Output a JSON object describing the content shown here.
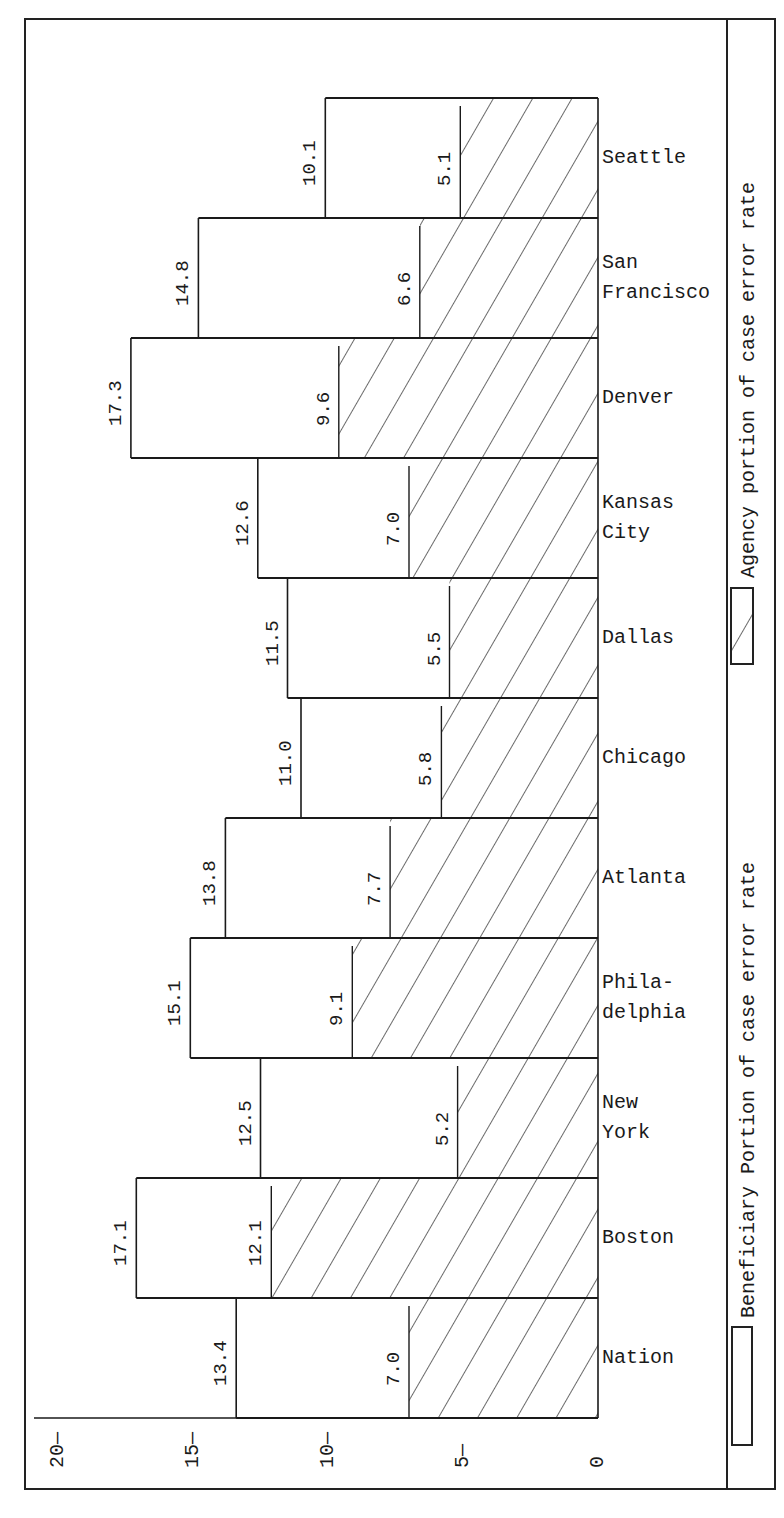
{
  "chart_data": {
    "type": "bar",
    "orientation": "rotated 90° (value axis horizontal, bars stacked vertically); overlapping bars",
    "title": "",
    "xlabel": "",
    "ylabel": "",
    "ylim": [
      0,
      20
    ],
    "ticks": [
      "0",
      "5",
      "10",
      "15",
      "20"
    ],
    "grid": false,
    "categories": [
      "Nation",
      "Boston",
      "New York",
      "Philadelphia",
      "Atlanta",
      "Chicago",
      "Dallas",
      "Kansas City",
      "Denver",
      "San Francisco",
      "Seattle"
    ],
    "category_labels": [
      "Nation",
      "Boston",
      "New\nYork",
      "Phila-\ndelphia",
      "Atlanta",
      "Chicago",
      "Dallas",
      "Kansas\nCity",
      "Denver",
      "San\nFrancisco",
      "Seattle"
    ],
    "series": [
      {
        "name": "Beneficiary Portion of case error rate",
        "fill": "blank",
        "values": [
          13.4,
          17.1,
          12.5,
          15.1,
          13.8,
          11.0,
          11.5,
          12.6,
          17.3,
          14.8,
          10.1
        ]
      },
      {
        "name": "Agency portion of case error rate",
        "fill": "diagonal-hatch",
        "values": [
          7.0,
          12.1,
          5.2,
          9.1,
          7.7,
          5.8,
          5.5,
          7.0,
          9.6,
          6.6,
          5.1
        ]
      }
    ],
    "data_labels_total": [
      "13.4",
      "17.1",
      "12.5",
      "15.1",
      "13.8",
      "11.0",
      "11.5",
      "12.6",
      "17.3",
      "14.8",
      "10.1"
    ],
    "data_labels_agency": [
      "7.0",
      "12.1",
      "5.2",
      "9.1",
      "7.7",
      "5.8",
      "5.5",
      "7.0",
      "9.6",
      "6.6",
      "5.1"
    ],
    "legend": {
      "position": "right edge (rotated)",
      "entries": [
        {
          "label": "Beneficiary Portion of case error rate",
          "swatch": "blank"
        },
        {
          "label": "Agency portion of case error rate",
          "swatch": "hatched"
        }
      ]
    }
  },
  "legend": {
    "beneficiary": "Beneficiary Portion of case error rate",
    "agency": "Agency portion of case error rate"
  },
  "colors": {
    "ink": "#1a1a1a",
    "paper": "#ffffff"
  }
}
